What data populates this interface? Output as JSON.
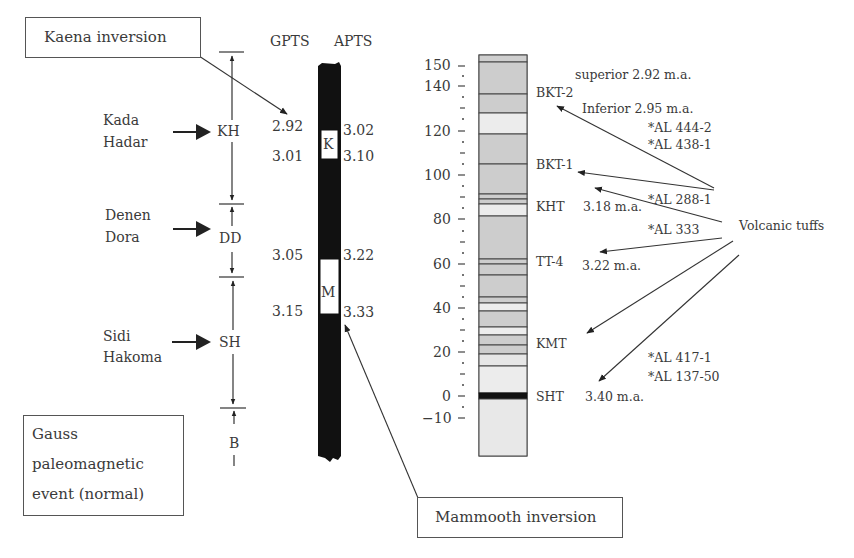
{
  "callouts": {
    "kaena": "Kaena inversion",
    "mammoth": "Mammooth inversion",
    "gauss": [
      "Gauss",
      "paleomagnetic",
      "event (normal)"
    ]
  },
  "columns": {
    "gpts": "GPTS",
    "apts": "APTS"
  },
  "members": [
    {
      "name_lines": [
        "Kada",
        "Hadar"
      ],
      "abbr": "KH"
    },
    {
      "name_lines": [
        "Denen",
        "Dora"
      ],
      "abbr": "DD"
    },
    {
      "name_lines": [
        "Sidi",
        "Hakoma"
      ],
      "abbr": "SH"
    },
    {
      "name_lines": [],
      "abbr": "B"
    }
  ],
  "polarity": {
    "events": [
      {
        "label": "K",
        "gpts_top": "2.92",
        "gpts_bottom": "3.01",
        "apts_top": "3.02",
        "apts_bottom": "3.10"
      },
      {
        "label": "M",
        "gpts_top": "3.05",
        "gpts_bottom": "3.15",
        "apts_top": "3.22",
        "apts_bottom": "3.33"
      }
    ]
  },
  "scale": {
    "ticks": [
      "150",
      "140",
      "120",
      "100",
      "80",
      "60",
      "40",
      "20",
      "0",
      "−10"
    ]
  },
  "tuffs": [
    {
      "name": "BKT-2"
    },
    {
      "name": "BKT-1"
    },
    {
      "name": "KHT",
      "age": "3.18 m.a."
    },
    {
      "name": "TT-4",
      "age": "3.22 m.a."
    },
    {
      "name": "KMT"
    },
    {
      "name": "SHT",
      "age": "3.40 m.a."
    }
  ],
  "annotations": {
    "superior": "superior 2.92 m.a.",
    "inferior": "Inferior 2.95 m.a.",
    "al444": "*AL 444-2",
    "al438": "*AL 438-1",
    "al288": "*AL 288-1",
    "al333": "*AL 333",
    "al417": "*AL 417-1",
    "al137": "*AL 137-50",
    "volcanic": "Volcanic tuffs"
  }
}
